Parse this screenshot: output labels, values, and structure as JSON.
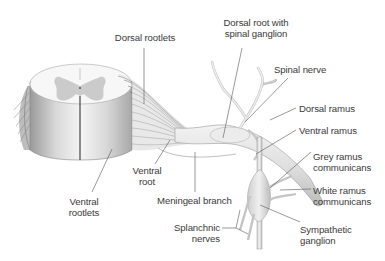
{
  "diagram": {
    "colors": {
      "label_text": "#3a3a3a",
      "leader_line": "#555555",
      "nerve_fill": "#e4e4e4",
      "grey_matter": "#c8c8c8"
    },
    "labels": {
      "dorsal_rootlets": "Dorsal rootlets",
      "dorsal_root_line1": "Dorsal root with",
      "dorsal_root_line2": "spinal ganglion",
      "spinal_nerve": "Spinal nerve",
      "dorsal_ramus": "Dorsal ramus",
      "ventral_ramus": "Ventral ramus",
      "grey_ramus_line1": "Grey ramus",
      "grey_ramus_line2": "communicans",
      "white_ramus_line1": "White ramus",
      "white_ramus_line2": "communicans",
      "sympathetic_line1": "Sympathetic",
      "sympathetic_line2": "ganglion",
      "splanchnic_line1": "Splanchnic",
      "splanchnic_line2": "nerves",
      "meningeal_branch": "Meningeal branch",
      "ventral_root_line1": "Ventral",
      "ventral_root_line2": "root",
      "ventral_rootlets_line1": "Ventral",
      "ventral_rootlets_line2": "rootlets"
    }
  }
}
